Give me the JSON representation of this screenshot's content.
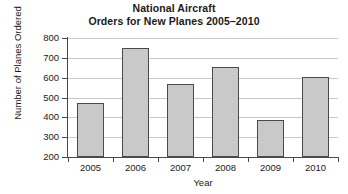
{
  "chart_data": {
    "type": "bar",
    "title": "National Aircraft",
    "subtitle": "Orders for New Planes 2005–2010",
    "title_lines": [
      "National Aircraft",
      "Orders for New Planes 2005–2010"
    ],
    "categories": [
      "2005",
      "2006",
      "2007",
      "2008",
      "2009",
      "2010"
    ],
    "values": [
      470,
      750,
      570,
      655,
      385,
      605
    ],
    "xlabel": "Year",
    "ylabel": "Number of Planes Ordered",
    "ylim": [
      200,
      800
    ],
    "ytick_labels": [
      "800",
      "700",
      "600",
      "500",
      "400",
      "300",
      "200"
    ],
    "ytick_values": [
      800,
      700,
      600,
      500,
      400,
      300,
      200
    ],
    "grid": true,
    "legend": null,
    "colors": {
      "bar_fill": "#c9c9c9",
      "bar_border": "#4a4a4a",
      "gridline": "#c9c9c9",
      "axis": "#4a4a4a",
      "text": "#1a1a1a",
      "background": "#ffffff"
    }
  }
}
